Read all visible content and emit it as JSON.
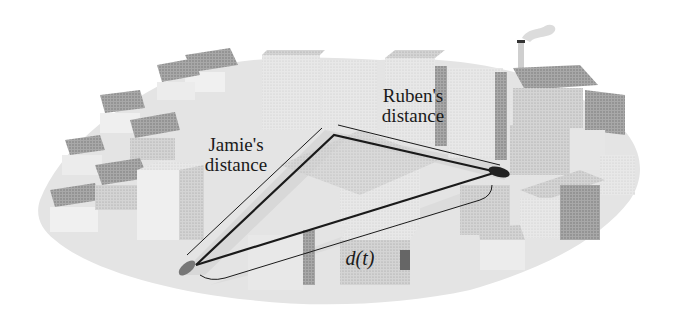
{
  "figure": {
    "labels": {
      "jamie": "Jamie's\ndistance",
      "ruben": "Ruben's\ndistance",
      "separation": "d(t)"
    },
    "colors": {
      "background": "#ffffff",
      "ground": "#e6e6e6",
      "road": "#d2d2d2",
      "building_light": "#d9d9d9",
      "building_mid": "#bdbdbd",
      "building_dark": "#9a9a9a",
      "path_line": "#1a1a1a"
    },
    "points": {
      "jamie_car": [
        196,
        265
      ],
      "corner": [
        334,
        135
      ],
      "ruben_car": [
        497,
        172
      ]
    }
  }
}
